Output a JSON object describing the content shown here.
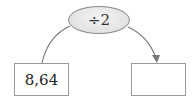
{
  "diagram": {
    "operation": {
      "label": "÷2",
      "fill": "#e2e2e2",
      "border": "#8a8a8a"
    },
    "input_box": {
      "value": "8,64"
    },
    "output_box": {
      "value": ""
    },
    "arrow_color": "#777777"
  }
}
